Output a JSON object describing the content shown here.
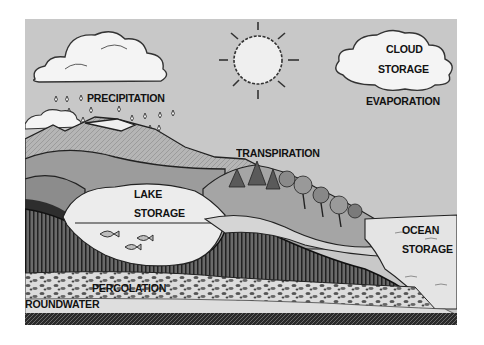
{
  "diagram": {
    "labels": {
      "precipitation": "PRECIPITATION",
      "cloud_storage_line1": "CLOUD",
      "cloud_storage_line2": "STORAGE",
      "evaporation": "EVAPORATION",
      "transpiration": "TRANSPIRATION",
      "lake_storage_line1": "LAKE",
      "lake_storage_line2": "STORAGE",
      "ocean_storage_line1": "OCEAN",
      "ocean_storage_line2": "STORAGE",
      "percolation": "PERCOLATION",
      "groundwater": "ROUNDWATER"
    },
    "elements": [
      "sun-icon",
      "rain-cloud",
      "storage-cloud",
      "raindrops",
      "mountains",
      "lake",
      "fish",
      "trees",
      "ocean",
      "soil-layer",
      "gravel-layer",
      "groundwater-layer",
      "bedrock"
    ],
    "colors": {
      "sky": "#c8c8c8",
      "ink": "#111111",
      "water": "#e6e6e6",
      "hills": "#a8a8a8",
      "soil": "#555555",
      "white": "#f5f5f5"
    }
  }
}
